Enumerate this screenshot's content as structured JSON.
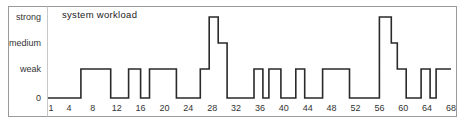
{
  "chart_data": {
    "type": "line",
    "subtype": "step",
    "title": "system workload",
    "xlabel": "",
    "ylabel": "",
    "x_range": [
      1,
      68
    ],
    "x_ticks": [
      1,
      4,
      8,
      12,
      16,
      20,
      24,
      28,
      32,
      36,
      40,
      44,
      48,
      52,
      56,
      60,
      64,
      68
    ],
    "y_levels": [
      {
        "label": "0",
        "value": 0
      },
      {
        "label": "weak",
        "value": 1
      },
      {
        "label": "medium",
        "value": 2
      },
      {
        "label": "strong",
        "value": 3
      }
    ],
    "grid": false,
    "legend": null,
    "segments": [
      {
        "from": 1,
        "to": 6,
        "level": 0
      },
      {
        "from": 6,
        "to": 11,
        "level": 1
      },
      {
        "from": 11,
        "to": 14,
        "level": 0
      },
      {
        "from": 14,
        "to": 16,
        "level": 1
      },
      {
        "from": 16,
        "to": 17.5,
        "level": 0
      },
      {
        "from": 17.5,
        "to": 22,
        "level": 1
      },
      {
        "from": 22,
        "to": 26,
        "level": 0
      },
      {
        "from": 26,
        "to": 27.5,
        "level": 1
      },
      {
        "from": 27.5,
        "to": 29,
        "level": 3
      },
      {
        "from": 29,
        "to": 30.5,
        "level": 2
      },
      {
        "from": 30.5,
        "to": 35,
        "level": 0
      },
      {
        "from": 35,
        "to": 36.5,
        "level": 1
      },
      {
        "from": 36.5,
        "to": 37.5,
        "level": 0
      },
      {
        "from": 37.5,
        "to": 39.5,
        "level": 1
      },
      {
        "from": 39.5,
        "to": 42,
        "level": 0
      },
      {
        "from": 42,
        "to": 43.5,
        "level": 1
      },
      {
        "from": 43.5,
        "to": 46.5,
        "level": 0
      },
      {
        "from": 46.5,
        "to": 51,
        "level": 1
      },
      {
        "from": 51,
        "to": 56,
        "level": 0
      },
      {
        "from": 56,
        "to": 58,
        "level": 3
      },
      {
        "from": 58,
        "to": 59,
        "level": 2
      },
      {
        "from": 59,
        "to": 60.5,
        "level": 1
      },
      {
        "from": 60.5,
        "to": 63,
        "level": 0
      },
      {
        "from": 63,
        "to": 64.5,
        "level": 1
      },
      {
        "from": 64.5,
        "to": 65.5,
        "level": 0
      },
      {
        "from": 65.5,
        "to": 68,
        "level": 1
      }
    ]
  },
  "layout": {
    "trace_color": "#2a2a2a",
    "frame_color": "#9a9a9a"
  }
}
